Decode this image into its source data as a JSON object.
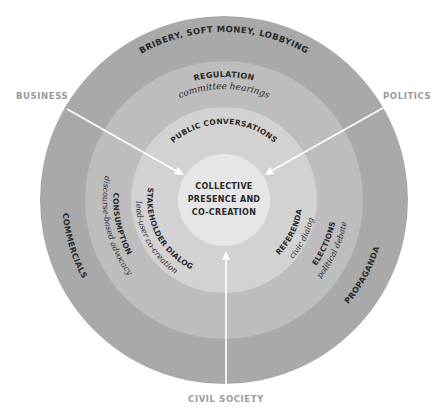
{
  "diagram": {
    "colors": {
      "outer_ring": "#a9a9a9",
      "ring_2": "#bdbdbd",
      "ring_3": "#d2d2d2",
      "center": "#e6e6e6",
      "arrow": "#ffffff",
      "side_label": "#9a9a9a"
    },
    "side_labels": {
      "business": "BUSINESS",
      "politics": "POLITICS",
      "civil_society": "CIVIL SOCIETY"
    },
    "center": {
      "line1": "COLLECTIVE",
      "line2": "PRESENCE AND",
      "line3": "CO-CREATION"
    },
    "outer_ring": {
      "top": "BRIBERY,  SOFT MONEY,  LOBBYING",
      "left": "COMMERCIALS",
      "right": "PROPAGANDA"
    },
    "ring_2": {
      "top_title": "REGULATION",
      "top_sub": "committee hearings",
      "left_title": "CONSUMPTION",
      "left_sub": "discourse-based advocacy",
      "right_title": "ELECTIONS",
      "right_sub": "political debate"
    },
    "ring_3": {
      "top": "PUBLIC CONVERSATIONS",
      "left_title": "STAKEHOLDER DIALOG",
      "left_sub": "lead-user co-creation",
      "right_title": "REFERENDA",
      "right_sub": "civic dialog"
    }
  }
}
